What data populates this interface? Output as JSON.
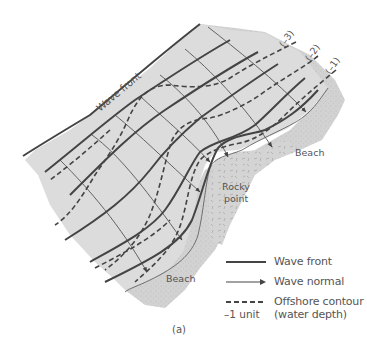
{
  "figure": {
    "caption": "(a)",
    "labels": {
      "wave_front": "Wave front",
      "beach_upper": "Beach",
      "beach_lower": "Beach",
      "rocky_point_line1": "Rocky",
      "rocky_point_line2": "point",
      "contour_3": "(–3)",
      "contour_2": "(–2)",
      "contour_1": "(–1)"
    },
    "colors": {
      "water": "#dcdcdc",
      "beach": "#cfcfcf",
      "lines": "#444444",
      "text": "#555555"
    }
  },
  "legend": {
    "items": [
      {
        "symbol": "solid-thick-line",
        "label": "Wave front"
      },
      {
        "symbol": "arrow-line",
        "label": "Wave normal"
      },
      {
        "symbol": "dashed-line",
        "label": "Offshore contour",
        "label2": "(water depth)",
        "unit": "–1 unit"
      }
    ]
  }
}
